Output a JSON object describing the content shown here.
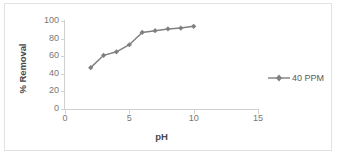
{
  "chart_data": {
    "type": "line",
    "title": "",
    "xlabel": "pH",
    "ylabel": "% Removal",
    "xlim": [
      0,
      15
    ],
    "ylim": [
      0,
      100
    ],
    "xticks": [
      "0",
      "5",
      "10",
      "15"
    ],
    "yticks": [
      "0",
      "20",
      "40",
      "60",
      "80",
      "100"
    ],
    "grid": false,
    "legend_position": "right",
    "series": [
      {
        "name": "40 PPM",
        "color": "#808080",
        "marker": "diamond",
        "x": [
          2,
          3,
          4,
          5,
          6,
          7,
          8,
          9,
          10
        ],
        "values": [
          47,
          61,
          65,
          73,
          87,
          89,
          91,
          92,
          94
        ]
      }
    ]
  },
  "axes": {
    "y_title": "% Removal",
    "x_title": "pH",
    "y_tick_labels": [
      "100",
      "80",
      "60",
      "40",
      "20",
      "0"
    ],
    "x_tick_labels": [
      "0",
      "5",
      "10",
      "15"
    ]
  },
  "legend": {
    "entries": [
      {
        "label": "40 PPM",
        "marker_icon": "line-diamond-marker-icon"
      }
    ]
  },
  "colors": {
    "series": "#808080",
    "axis": "#d0d0d0",
    "tick_text": "#767676",
    "title_text": "#4a4a4a",
    "frame_border": "#e2e2e2",
    "background": "#ffffff"
  }
}
